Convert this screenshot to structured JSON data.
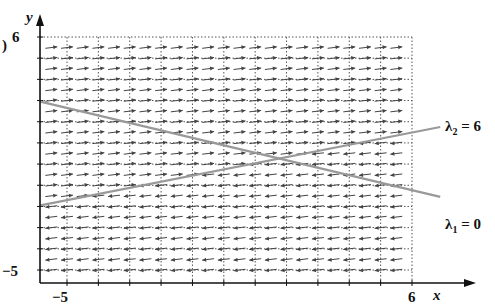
{
  "figure": {
    "part_label": ")",
    "top_fragment": "[   ]        [   ]"
  },
  "chart_data": {
    "type": "direction_field",
    "title": "",
    "xlabel": "x",
    "ylabel": "y",
    "xlim": [
      -5,
      6
    ],
    "ylim": [
      -5,
      6
    ],
    "x_ticks_labeled": [
      "-5",
      "6"
    ],
    "y_ticks_labeled": [
      "-5",
      "6"
    ],
    "grid": "dotted, unit spacing",
    "field_description": "Arrows point right (nearly horizontal) above the lambda2 line, left below it",
    "lines": [
      {
        "name": "λ2 = 6",
        "label": "λ2 = 6",
        "endpoints": [
          [
            -5.85,
            -1.95
          ],
          [
            6.9,
            1.75
          ]
        ],
        "color": "#999999"
      },
      {
        "name": "λ1 = 0",
        "label": "λ1 = 0",
        "endpoints": [
          [
            -5.85,
            2.95
          ],
          [
            6.9,
            -1.55
          ]
        ],
        "color": "#999999"
      }
    ]
  },
  "labels": {
    "y_axis": "y",
    "x_axis": "x",
    "y_top": "6",
    "y_bottom": "−5",
    "x_left": "−5",
    "x_right": "6",
    "lambda2": "λ",
    "lambda2_sub": "2",
    "lambda2_val": " = 6",
    "lambda1": "λ",
    "lambda1_sub": "1",
    "lambda1_val": " = 0"
  },
  "colors": {
    "axis": "#111111",
    "grid": "#555555",
    "arrow": "#444444",
    "line": "#9a9a9a"
  }
}
